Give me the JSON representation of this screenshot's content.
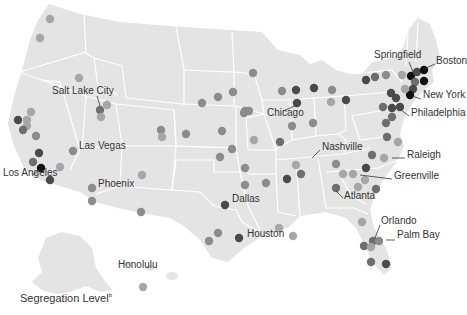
{
  "legend": {
    "title": "Segregation Level",
    "footnote_marker": "b"
  },
  "colors": {
    "land": "#e4e4e4",
    "border": "#ffffff",
    "level_1": "#a6a6a6",
    "level_2": "#8c8c8c",
    "level_3": "#6e6e6e",
    "level_4": "#4a4a4a",
    "level_5": "#111111"
  },
  "city_labels": [
    {
      "name": "Springfield",
      "x": 374,
      "y": 55
    },
    {
      "name": "Boston",
      "x": 436,
      "y": 61
    },
    {
      "name": "New York",
      "x": 423,
      "y": 95
    },
    {
      "name": "Philadelphia",
      "x": 411,
      "y": 113
    },
    {
      "name": "Salt Lake City",
      "x": 52,
      "y": 91
    },
    {
      "name": "Chicago",
      "x": 267,
      "y": 113
    },
    {
      "name": "Nashville",
      "x": 322,
      "y": 147
    },
    {
      "name": "Raleigh",
      "x": 407,
      "y": 155
    },
    {
      "name": "Las Vegas",
      "x": 79,
      "y": 146
    },
    {
      "name": "Greenville",
      "x": 394,
      "y": 176
    },
    {
      "name": "Los Angeles",
      "x": 3,
      "y": 173
    },
    {
      "name": "Phoenix",
      "x": 98,
      "y": 184
    },
    {
      "name": "Atlanta",
      "x": 344,
      "y": 196
    },
    {
      "name": "Dallas",
      "x": 232,
      "y": 199
    },
    {
      "name": "Orlando",
      "x": 381,
      "y": 221
    },
    {
      "name": "Houston",
      "x": 247,
      "y": 234
    },
    {
      "name": "Palm Bay",
      "x": 397,
      "y": 235
    },
    {
      "name": "Honolulu",
      "x": 118,
      "y": 265
    }
  ],
  "dots": [
    {
      "x": 50,
      "y": 19,
      "level": 1
    },
    {
      "x": 40,
      "y": 38,
      "level": 1
    },
    {
      "x": 79,
      "y": 78,
      "level": 1
    },
    {
      "x": 100,
      "y": 110,
      "level": 3
    },
    {
      "x": 107,
      "y": 105,
      "level": 1
    },
    {
      "x": 101,
      "y": 117,
      "level": 1
    },
    {
      "x": 31,
      "y": 112,
      "level": 1
    },
    {
      "x": 18,
      "y": 120,
      "level": 4
    },
    {
      "x": 27,
      "y": 120,
      "level": 1
    },
    {
      "x": 27,
      "y": 126,
      "level": 1
    },
    {
      "x": 23,
      "y": 130,
      "level": 3
    },
    {
      "x": 36,
      "y": 136,
      "level": 2
    },
    {
      "x": 39,
      "y": 153,
      "level": 4
    },
    {
      "x": 33,
      "y": 162,
      "level": 3
    },
    {
      "x": 41,
      "y": 168,
      "level": 5
    },
    {
      "x": 50,
      "y": 180,
      "level": 4
    },
    {
      "x": 60,
      "y": 167,
      "level": 1
    },
    {
      "x": 73,
      "y": 151,
      "level": 2
    },
    {
      "x": 92,
      "y": 188,
      "level": 2
    },
    {
      "x": 92,
      "y": 201,
      "level": 2
    },
    {
      "x": 142,
      "y": 175,
      "level": 1
    },
    {
      "x": 141,
      "y": 212,
      "level": 2
    },
    {
      "x": 161,
      "y": 130,
      "level": 2
    },
    {
      "x": 162,
      "y": 137,
      "level": 1
    },
    {
      "x": 143,
      "y": 287,
      "level": 1
    },
    {
      "x": 253,
      "y": 73,
      "level": 2
    },
    {
      "x": 233,
      "y": 92,
      "level": 2
    },
    {
      "x": 249,
      "y": 111,
      "level": 2
    },
    {
      "x": 222,
      "y": 131,
      "level": 2
    },
    {
      "x": 232,
      "y": 149,
      "level": 2
    },
    {
      "x": 220,
      "y": 157,
      "level": 2
    },
    {
      "x": 245,
      "y": 185,
      "level": 2
    },
    {
      "x": 225,
      "y": 205,
      "level": 4
    },
    {
      "x": 218,
      "y": 233,
      "level": 2
    },
    {
      "x": 209,
      "y": 241,
      "level": 2
    },
    {
      "x": 239,
      "y": 238,
      "level": 4
    },
    {
      "x": 279,
      "y": 228,
      "level": 1
    },
    {
      "x": 293,
      "y": 236,
      "level": 1
    },
    {
      "x": 186,
      "y": 134,
      "level": 2
    },
    {
      "x": 244,
      "y": 113,
      "level": 2
    },
    {
      "x": 202,
      "y": 103,
      "level": 2
    },
    {
      "x": 218,
      "y": 97,
      "level": 2
    },
    {
      "x": 282,
      "y": 91,
      "level": 2
    },
    {
      "x": 296,
      "y": 90,
      "level": 4
    },
    {
      "x": 314,
      "y": 88,
      "level": 4
    },
    {
      "x": 332,
      "y": 90,
      "level": 2
    },
    {
      "x": 331,
      "y": 102,
      "level": 1
    },
    {
      "x": 297,
      "y": 103,
      "level": 4
    },
    {
      "x": 346,
      "y": 100,
      "level": 4
    },
    {
      "x": 313,
      "y": 123,
      "level": 2
    },
    {
      "x": 292,
      "y": 126,
      "level": 2
    },
    {
      "x": 245,
      "y": 111,
      "level": 2
    },
    {
      "x": 254,
      "y": 140,
      "level": 1
    },
    {
      "x": 245,
      "y": 168,
      "level": 2
    },
    {
      "x": 280,
      "y": 142,
      "level": 3
    },
    {
      "x": 287,
      "y": 179,
      "level": 4
    },
    {
      "x": 266,
      "y": 183,
      "level": 2
    },
    {
      "x": 301,
      "y": 174,
      "level": 3
    },
    {
      "x": 336,
      "y": 164,
      "level": 2
    },
    {
      "x": 343,
      "y": 174,
      "level": 1
    },
    {
      "x": 296,
      "y": 165,
      "level": 1
    },
    {
      "x": 366,
      "y": 80,
      "level": 4
    },
    {
      "x": 375,
      "y": 77,
      "level": 3
    },
    {
      "x": 386,
      "y": 75,
      "level": 2
    },
    {
      "x": 402,
      "y": 75,
      "level": 1
    },
    {
      "x": 411,
      "y": 76,
      "level": 5
    },
    {
      "x": 417,
      "y": 72,
      "level": 4
    },
    {
      "x": 424,
      "y": 70,
      "level": 5
    },
    {
      "x": 424,
      "y": 81,
      "level": 5
    },
    {
      "x": 415,
      "y": 82,
      "level": 3
    },
    {
      "x": 413,
      "y": 89,
      "level": 4
    },
    {
      "x": 410,
      "y": 95,
      "level": 5
    },
    {
      "x": 405,
      "y": 89,
      "level": 1
    },
    {
      "x": 391,
      "y": 93,
      "level": 4
    },
    {
      "x": 396,
      "y": 98,
      "level": 4
    },
    {
      "x": 383,
      "y": 107,
      "level": 3
    },
    {
      "x": 392,
      "y": 108,
      "level": 4
    },
    {
      "x": 400,
      "y": 107,
      "level": 4
    },
    {
      "x": 392,
      "y": 117,
      "level": 3
    },
    {
      "x": 386,
      "y": 123,
      "level": 3
    },
    {
      "x": 387,
      "y": 137,
      "level": 3
    },
    {
      "x": 398,
      "y": 142,
      "level": 1
    },
    {
      "x": 372,
      "y": 155,
      "level": 3
    },
    {
      "x": 384,
      "y": 158,
      "level": 1
    },
    {
      "x": 366,
      "y": 168,
      "level": 4
    },
    {
      "x": 353,
      "y": 174,
      "level": 1
    },
    {
      "x": 365,
      "y": 180,
      "level": 1
    },
    {
      "x": 358,
      "y": 187,
      "level": 1
    },
    {
      "x": 376,
      "y": 189,
      "level": 3
    },
    {
      "x": 336,
      "y": 188,
      "level": 3
    },
    {
      "x": 362,
      "y": 222,
      "level": 1
    },
    {
      "x": 373,
      "y": 241,
      "level": 3
    },
    {
      "x": 379,
      "y": 241,
      "level": 2
    },
    {
      "x": 364,
      "y": 246,
      "level": 3
    },
    {
      "x": 371,
      "y": 247,
      "level": 1
    },
    {
      "x": 371,
      "y": 262,
      "level": 3
    },
    {
      "x": 386,
      "y": 264,
      "level": 4
    }
  ]
}
